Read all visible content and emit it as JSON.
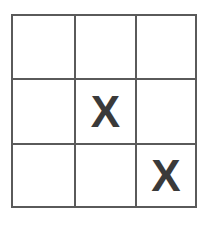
{
  "board": {
    "rows": 3,
    "cols": 3,
    "line_color": "#5a5a5a",
    "mark_color": "#3a3a3a",
    "cells": [
      {
        "row": 0,
        "col": 0,
        "mark": ""
      },
      {
        "row": 0,
        "col": 1,
        "mark": ""
      },
      {
        "row": 0,
        "col": 2,
        "mark": ""
      },
      {
        "row": 1,
        "col": 0,
        "mark": ""
      },
      {
        "row": 1,
        "col": 1,
        "mark": "X"
      },
      {
        "row": 1,
        "col": 2,
        "mark": ""
      },
      {
        "row": 2,
        "col": 0,
        "mark": ""
      },
      {
        "row": 2,
        "col": 1,
        "mark": ""
      },
      {
        "row": 2,
        "col": 2,
        "mark": "X"
      }
    ]
  }
}
